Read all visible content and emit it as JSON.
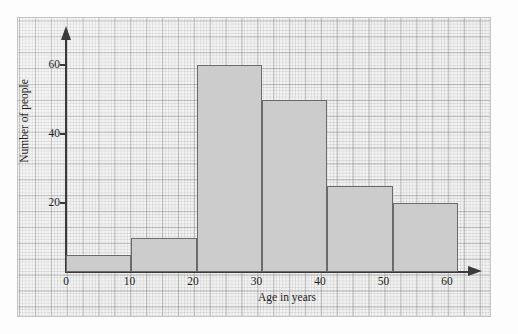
{
  "chart_data": {
    "type": "bar",
    "title": "",
    "subtitle": "",
    "xlabel": "Age in years",
    "ylabel": "Number of people",
    "categories": [
      "0-10",
      "10-20",
      "20-30",
      "30-40",
      "40-50",
      "50-60"
    ],
    "bin_edges": [
      0,
      10,
      20,
      30,
      40,
      50,
      60
    ],
    "values": [
      5,
      10,
      60,
      50,
      25,
      20
    ],
    "x_ticks": [
      0,
      10,
      20,
      30,
      40,
      50,
      60
    ],
    "x_tick_labels": [
      "0",
      "10",
      "20",
      "30",
      "40",
      "50",
      "60"
    ],
    "y_ticks": [
      20,
      40,
      60
    ],
    "y_tick_labels": [
      "20",
      "40",
      "60"
    ],
    "xlim": [
      0,
      60
    ],
    "ylim": [
      0,
      65
    ],
    "grid": true,
    "grid_style": "graph-paper",
    "legend": null,
    "legend_position": "none",
    "annotations": [],
    "bar_fill_color": "#cccccc",
    "bar_edge_color": "#6a6a6a",
    "axis_color": "#3a3a3a",
    "paper_color": "#f3f3f1",
    "grid_color": "#8a8a92"
  },
  "axes": {
    "y_label": "Number of people",
    "x_label": "Age in years"
  }
}
